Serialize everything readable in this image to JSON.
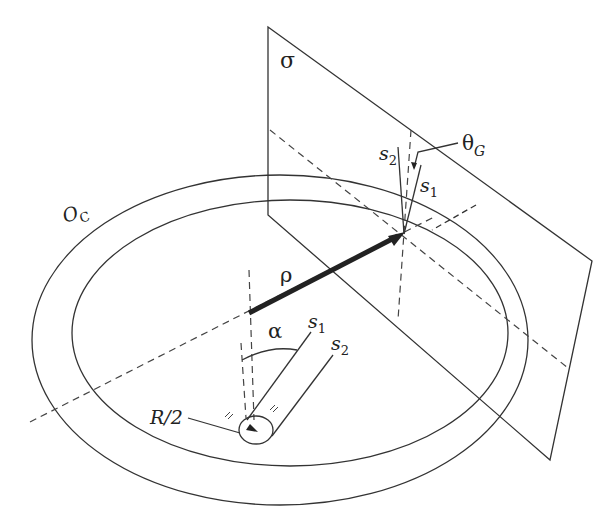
{
  "labels": {
    "plane": "σ",
    "circle": "O",
    "circle_sub": "C",
    "rho": "ρ",
    "alpha": "α",
    "s1_bottom": "s",
    "s1_bottom_sub": "1",
    "s2_bottom": "s",
    "s2_bottom_sub": "2",
    "s1_top": "s",
    "s1_top_sub": "1",
    "s2_top": "s",
    "s2_top_sub": "2",
    "theta": "θ",
    "theta_sub": "G",
    "radius": "R/2"
  },
  "colors": {
    "stroke": "#333333",
    "background": "#ffffff"
  }
}
